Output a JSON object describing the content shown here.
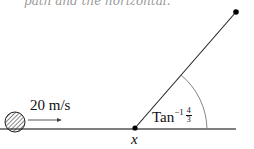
{
  "header_fragment": "path and the horizontal.",
  "labels": {
    "speed": "20 m/s",
    "point": "x",
    "angle_prefix": "Tan",
    "angle_exponent": "−1",
    "angle_numerator": "4",
    "angle_denominator": "3"
  },
  "geometry": {
    "ground_y": 129,
    "ball": {
      "cx": 15,
      "cy": 122,
      "r": 10
    },
    "arrow": {
      "x1": 28,
      "y1": 120,
      "x2": 62,
      "y2": 120
    },
    "base_point": {
      "x": 135,
      "y": 128
    },
    "top_point": {
      "x": 236,
      "y": 12
    }
  },
  "colors": {
    "line": "#222222",
    "ground": "#555555",
    "arc": "#777777"
  }
}
